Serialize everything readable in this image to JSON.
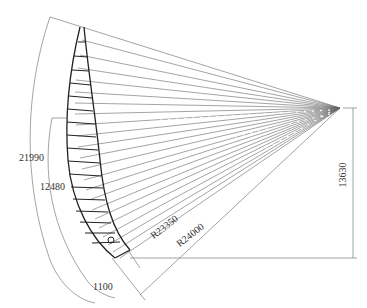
{
  "drawing": {
    "title": "Blade planform layout with radial section lines",
    "colors": {
      "line": "#555555",
      "blade": "#222222",
      "dim": "#666666",
      "background": "#ffffff"
    },
    "apex": [
      340,
      108
    ],
    "radial_line_count": 24,
    "dimensions": {
      "arc_outer": "21990",
      "arc_inner": "12480",
      "arc_root": "1100",
      "radius_inner": "R23350",
      "radius_outer": "R24000",
      "height": "13630"
    }
  }
}
